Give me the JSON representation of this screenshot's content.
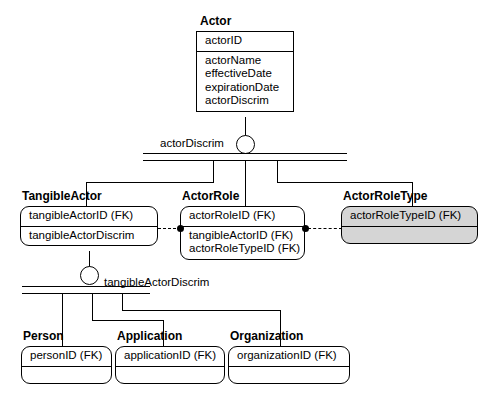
{
  "diagram": {
    "type": "entity-relationship-diagram",
    "colors": {
      "line": "#000000",
      "background": "#ffffff",
      "shaded_fill": "#d5d5d5"
    }
  },
  "entities": {
    "actor": {
      "name": "Actor",
      "key": "actorID",
      "attributes": [
        "actorName",
        "effectiveDate",
        "expirationDate",
        "actorDiscrim"
      ],
      "shaded": false,
      "rounded": false
    },
    "tangible_actor": {
      "name": "TangibleActor",
      "key": "tangibleActorID (FK)",
      "attributes": [
        "tangibleActorDiscrim"
      ],
      "shaded": false,
      "rounded": true
    },
    "actor_role": {
      "name": "ActorRole",
      "key": "actorRoleID (FK)",
      "attributes": [
        "tangibleActorID (FK)",
        "actorRoleTypeID (FK)"
      ],
      "shaded": false,
      "rounded": true
    },
    "actor_role_type": {
      "name": "ActorRoleType",
      "key": "actorRoleTypeID (FK)",
      "attributes": [],
      "shaded": true,
      "rounded": true
    },
    "person": {
      "name": "Person",
      "key": "personID (FK)",
      "attributes": [],
      "shaded": false,
      "rounded": true
    },
    "application": {
      "name": "Application",
      "key": "applicationID (FK)",
      "attributes": [],
      "shaded": false,
      "rounded": true
    },
    "organization": {
      "name": "Organization",
      "key": "organizationID (FK)",
      "attributes": [],
      "shaded": false,
      "rounded": true
    }
  },
  "discriminators": {
    "actor": {
      "label": "actorDiscrim",
      "parent": "Actor",
      "children": [
        "TangibleActor",
        "ActorRole",
        "ActorRoleType"
      ]
    },
    "tangible_actor": {
      "label": "tangibleActorDiscrim",
      "parent": "TangibleActor",
      "children": [
        "Person",
        "Application",
        "Organization"
      ]
    }
  },
  "relationships": [
    {
      "from": "TangibleActor",
      "to": "ActorRole",
      "style": "dashed",
      "end_marker": "filled-circle"
    },
    {
      "from": "ActorRole",
      "to": "ActorRoleType",
      "style": "dashed",
      "end_marker": "filled-circle"
    }
  ]
}
